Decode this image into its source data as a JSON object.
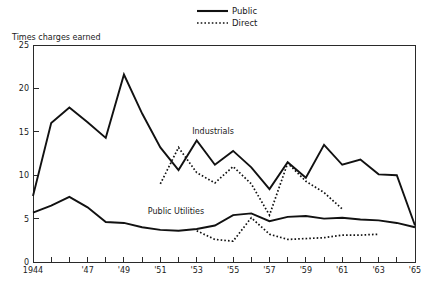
{
  "chart_data": {
    "type": "line",
    "title": "",
    "subtitle": "",
    "xlabel": "",
    "ylabel": "Times charges earned",
    "ylim": [
      0,
      25
    ],
    "xlim": [
      1944,
      1965
    ],
    "grid": false,
    "legend_position": "top-center",
    "y_ticks": [
      "0",
      "5",
      "10",
      "15",
      "20",
      "25"
    ],
    "y_tick_values": [
      0,
      5,
      10,
      15,
      20,
      25
    ],
    "x_ticks": [
      "1944",
      "'45",
      "'46",
      "'47",
      "'48",
      "'49",
      "'50",
      "'51",
      "'52",
      "'53",
      "'54",
      "'55",
      "'56",
      "'57",
      "'58",
      "'59",
      "'60",
      "'61",
      "'62",
      "'63",
      "'64",
      "'65"
    ],
    "x_tick_values": [
      1944,
      1945,
      1946,
      1947,
      1948,
      1949,
      1950,
      1951,
      1952,
      1953,
      1954,
      1955,
      1956,
      1957,
      1958,
      1959,
      1960,
      1961,
      1962,
      1963,
      1964,
      1965
    ],
    "x_tick_labels_shown": [
      "1944",
      "",
      "",
      "'47",
      "",
      "'49",
      "",
      "'51",
      "",
      "'53",
      "",
      "'55",
      "",
      "'57",
      "",
      "'59",
      "",
      "'61",
      "",
      "'63",
      "",
      "'65"
    ],
    "legend": [
      {
        "name": "Public",
        "style": "solid"
      },
      {
        "name": "Direct",
        "style": "dotted"
      }
    ],
    "annotations": [
      {
        "text": "Industrials",
        "x": 1955.0,
        "y": 14.6
      },
      {
        "text": "Public Utilities",
        "x": 1950.6,
        "y": 6.6
      }
    ],
    "series": [
      {
        "name": "Industrials Public",
        "group": "Industrials",
        "style": "solid",
        "x": [
          1944,
          1945,
          1946,
          1947,
          1948,
          1949,
          1950,
          1951,
          1952,
          1953,
          1954,
          1955,
          1956,
          1957,
          1958,
          1959,
          1960,
          1961,
          1962,
          1963,
          1964,
          1965
        ],
        "values": [
          7.6,
          16.0,
          17.8,
          16.1,
          14.3,
          21.6,
          17.1,
          13.2,
          10.6,
          14.0,
          11.2,
          12.8,
          10.9,
          8.4,
          11.5,
          9.7,
          13.5,
          11.2,
          11.8,
          10.1,
          10.0,
          4.2
        ]
      },
      {
        "name": "Industrials Direct",
        "group": "Industrials",
        "style": "dotted",
        "x": [
          1951,
          1952,
          1953,
          1954,
          1955,
          1956,
          1957,
          1958,
          1959,
          1960,
          1961
        ],
        "values": [
          9.0,
          13.2,
          10.3,
          9.1,
          11.0,
          9.0,
          5.4,
          11.4,
          9.3,
          8.0,
          6.1
        ]
      },
      {
        "name": "Public Utilities Public",
        "group": "Public Utilities",
        "style": "solid",
        "x": [
          1944,
          1945,
          1946,
          1947,
          1948,
          1949,
          1950,
          1951,
          1952,
          1953,
          1954,
          1955,
          1956,
          1957,
          1958,
          1959,
          1960,
          1961,
          1962,
          1963,
          1964,
          1965
        ],
        "values": [
          5.7,
          6.5,
          7.5,
          6.3,
          4.6,
          4.5,
          4.0,
          3.7,
          3.6,
          3.8,
          4.2,
          5.4,
          5.6,
          4.7,
          5.2,
          5.3,
          5.0,
          5.1,
          4.9,
          4.8,
          4.5,
          4.0
        ]
      },
      {
        "name": "Public Utilities Direct",
        "group": "Public Utilities",
        "style": "dotted",
        "x": [
          1953,
          1954,
          1955,
          1956,
          1957,
          1958,
          1959,
          1960,
          1961,
          1962,
          1963
        ],
        "values": [
          3.6,
          2.6,
          2.4,
          5.1,
          3.2,
          2.6,
          2.7,
          2.8,
          3.1,
          3.1,
          3.2
        ]
      }
    ]
  },
  "colors": {
    "line": "#111111",
    "axis": "#2a2a2a",
    "background": "#ffffff"
  }
}
